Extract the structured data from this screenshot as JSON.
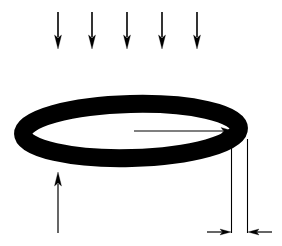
{
  "canvas": {
    "width": 282,
    "height": 246,
    "background": "#ffffff",
    "ink": "#000000",
    "title": "Ring loaded by downward distributed force with radius and thickness dimensions"
  },
  "ring": {
    "label": "ring",
    "shape": "ellipse-annulus",
    "center_x": 131,
    "center_y": 131,
    "outer_rx": 117,
    "outer_ry": 36,
    "stroke_width": 18,
    "rotation_deg": -1.5,
    "color": "#000000"
  },
  "load_arrows": {
    "label": "downward load arrows",
    "count": 5,
    "direction": "down",
    "color": "#000000",
    "shaft_width": 1.6,
    "head_width": 7,
    "head_length": 14,
    "y_start": 12,
    "y_end": 49,
    "x_positions": [
      58,
      92,
      127,
      162,
      197
    ]
  },
  "support_arrow": {
    "label": "upward support arrow",
    "direction": "up",
    "color": "#000000",
    "x": 58,
    "y_start": 233,
    "y_end": 172,
    "shaft_width": 1.2,
    "head_width": 7,
    "head_length": 14
  },
  "radius_arrow": {
    "label": "radius dimension arrow",
    "direction": "right",
    "color": "#000000",
    "y": 131,
    "x_start": 134,
    "x_end": 233,
    "shaft_width": 1.2,
    "head_width": 7,
    "head_length": 12
  },
  "thickness_dimension": {
    "label": "ring thickness dimension",
    "color": "#000000",
    "baseline_y": 232,
    "extension_lines": [
      {
        "name": "inner-extension-line",
        "x": 231.5,
        "y_top": 133,
        "y_bottom": 233
      },
      {
        "name": "outer-extension-line",
        "x": 247.5,
        "y_top": 139,
        "y_bottom": 233
      }
    ],
    "left_arrow": {
      "x_start": 207,
      "x_end": 231,
      "direction": "right"
    },
    "right_arrow": {
      "x_start": 272,
      "x_end": 248,
      "direction": "left"
    },
    "shaft_width": 1.2,
    "head_width": 6,
    "head_length": 11
  }
}
